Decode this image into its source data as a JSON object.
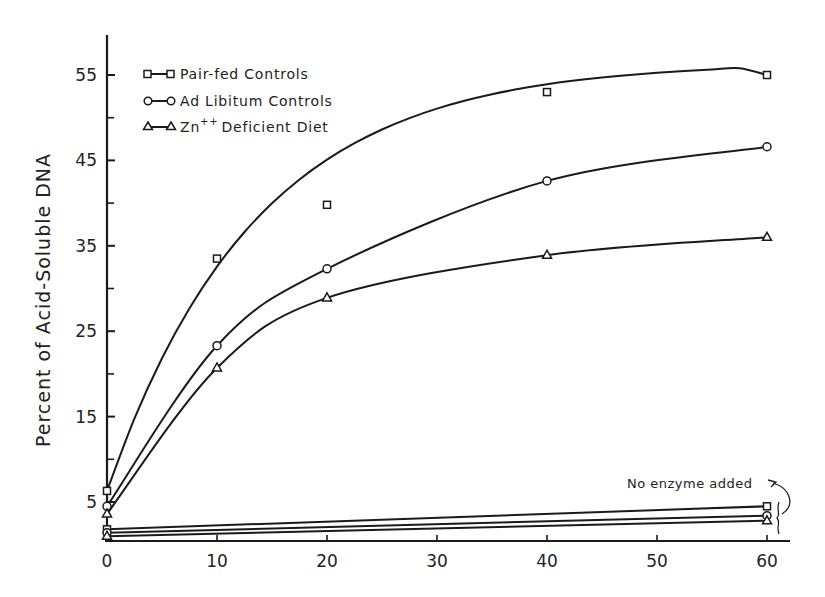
{
  "chart_data": {
    "type": "line",
    "title": "",
    "xlabel": "",
    "ylabel": "Percent of Acid-Soluble DNA",
    "x": [
      0,
      10,
      20,
      40,
      60
    ],
    "xlim": [
      0,
      62
    ],
    "ylim": [
      0,
      60
    ],
    "x_ticks": [
      0,
      10,
      20,
      30,
      40,
      50,
      60
    ],
    "y_tick_labels": [
      5,
      15,
      25,
      35,
      45,
      55
    ],
    "y_minor_ticks": [
      10,
      20,
      30,
      40,
      50
    ],
    "grid": false,
    "legend_position": "upper left",
    "series": [
      {
        "name": "Pair-fed Controls",
        "marker": "square",
        "values": [
          6.3,
          33.5,
          39.8,
          53.0,
          55.0
        ]
      },
      {
        "name": "Ad Libitum Controls",
        "marker": "circle",
        "values": [
          4.5,
          23.3,
          32.3,
          42.6,
          46.6
        ]
      },
      {
        "name": "Zn++ Deficient Diet",
        "marker": "triangle",
        "values": [
          3.6,
          20.7,
          28.9,
          33.9,
          36.0
        ]
      }
    ],
    "no_enzyme_series": [
      {
        "name": "Pair-fed Controls (no enzyme)",
        "marker": "square",
        "x": [
          0,
          60
        ],
        "values": [
          1.8,
          4.5
        ]
      },
      {
        "name": "Ad Libitum Controls (no enzyme)",
        "marker": "circle",
        "x": [
          0,
          60
        ],
        "values": [
          1.4,
          3.4
        ]
      },
      {
        "name": "Zn++ Deficient Diet (no enzyme)",
        "marker": "triangle",
        "x": [
          0,
          60
        ],
        "values": [
          1.0,
          2.8
        ]
      }
    ],
    "annotations": [
      "No enzyme added"
    ]
  },
  "legend": {
    "items": [
      {
        "label": "Pair-fed Controls"
      },
      {
        "label": "Ad Libitum Controls"
      },
      {
        "label_prefix": "Zn",
        "label_sup": "++",
        "label_rest": "Deficient Diet"
      }
    ]
  },
  "axes": {
    "ylabel": "Percent of Acid-Soluble DNA",
    "y_ticks": [
      "55",
      "45",
      "35",
      "25",
      "15",
      "5"
    ],
    "x_ticks": [
      "0",
      "10",
      "20",
      "30",
      "40",
      "50",
      "60"
    ]
  },
  "annotation": {
    "text": "No enzyme added"
  }
}
